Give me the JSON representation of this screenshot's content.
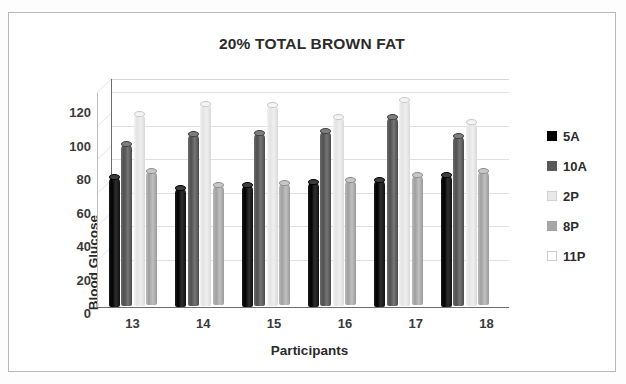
{
  "chart_data": {
    "type": "bar",
    "title": "20% TOTAL BROWN FAT",
    "xlabel": "Participants",
    "ylabel": "Blood Glucose",
    "categories": [
      "13",
      "14",
      "15",
      "16",
      "17",
      "18"
    ],
    "ylim": [
      0,
      120
    ],
    "ytick_step": 20,
    "yticks": [
      "120",
      "100",
      "80",
      "60",
      "40",
      "20",
      "0"
    ],
    "grid": true,
    "legend_position": "right",
    "three_d": true,
    "series": [
      {
        "name": "5A",
        "color": "#000000",
        "values": [
          78,
          71,
          73,
          75,
          76,
          79
        ]
      },
      {
        "name": "10A",
        "color": "#595959",
        "values": [
          97,
          103,
          104,
          105,
          113,
          102
        ]
      },
      {
        "name": "2P",
        "color": "#E8E8E8",
        "values": [
          115,
          121,
          120,
          113,
          123,
          110
        ]
      },
      {
        "name": "8P",
        "color": "#A6A6A6",
        "values": [
          80,
          72,
          73,
          75,
          78,
          80
        ]
      },
      {
        "name": "11P",
        "color": "#FFFFFF",
        "values": [
          0,
          0,
          0,
          0,
          0,
          0
        ]
      }
    ]
  },
  "legend": {
    "items": [
      {
        "label": "5A"
      },
      {
        "label": "10A"
      },
      {
        "label": "2P"
      },
      {
        "label": "8P"
      },
      {
        "label": "11P"
      }
    ]
  }
}
